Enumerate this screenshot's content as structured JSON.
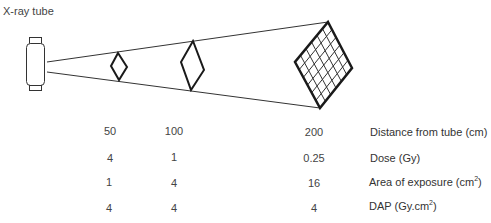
{
  "title": "X-ray tube",
  "diagram": {
    "source_label": "X-ray tube",
    "planes": [
      {
        "distance": "50",
        "shape": "small-diamond"
      },
      {
        "distance": "100",
        "shape": "medium-diamond"
      },
      {
        "distance": "200",
        "shape": "large-grid-diamond"
      }
    ],
    "colors": {
      "stroke": "#1a1a1a",
      "beam": "#333333",
      "text": "#444444"
    }
  },
  "table": {
    "columns": [
      "50",
      "100",
      "200"
    ],
    "rows": [
      {
        "label": "Distance from tube",
        "unit": "(cm)",
        "unit_sup": "",
        "unit_tail": "",
        "values": [
          "50",
          "100",
          "200"
        ]
      },
      {
        "label": "Dose",
        "unit": "(Gy)",
        "unit_sup": "",
        "unit_tail": "",
        "values": [
          "4",
          "1",
          "0.25"
        ]
      },
      {
        "label": "Area of exposure",
        "unit": "(cm",
        "unit_sup": "2",
        "unit_tail": ")",
        "values": [
          "1",
          "4",
          "16"
        ]
      },
      {
        "label": "DAP",
        "unit": "(Gy.cm",
        "unit_sup": "2",
        "unit_tail": ")",
        "values": [
          "4",
          "4",
          "4"
        ]
      }
    ]
  }
}
